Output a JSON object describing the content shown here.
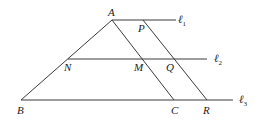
{
  "diagram": {
    "type": "geometry",
    "points": {
      "A": {
        "label": "A",
        "x": 112,
        "y": 20
      },
      "P": {
        "label": "P",
        "x": 143,
        "y": 20
      },
      "N": {
        "label": "N",
        "x": 68,
        "y": 59
      },
      "M": {
        "label": "M",
        "x": 142,
        "y": 59
      },
      "Q": {
        "label": "Q",
        "x": 174,
        "y": 59
      },
      "B": {
        "label": "B",
        "x": 21,
        "y": 100
      },
      "C": {
        "label": "C",
        "x": 174,
        "y": 100
      },
      "R": {
        "label": "R",
        "x": 207,
        "y": 100
      }
    },
    "lines": [
      {
        "name": "l1",
        "label": "ℓ",
        "subscript": "1",
        "y": 20,
        "x1": 112,
        "x2": 176
      },
      {
        "name": "l2",
        "label": "ℓ",
        "subscript": "2",
        "y": 59,
        "x1": 68,
        "x2": 207
      },
      {
        "name": "l3",
        "label": "ℓ",
        "subscript": "3",
        "y": 100,
        "x1": 21,
        "x2": 233
      }
    ],
    "segments": [
      {
        "from": "A",
        "to": "B"
      },
      {
        "from": "A",
        "to": "C"
      },
      {
        "from": "P",
        "to": "R"
      }
    ]
  }
}
